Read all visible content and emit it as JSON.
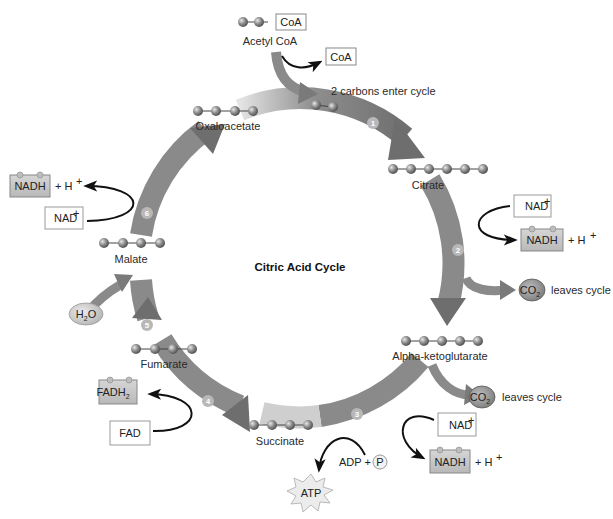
{
  "title": "Citric Acid Cycle",
  "colors": {
    "ring_dark": "#7a7a7a",
    "ring_light": "#d8d8d8",
    "carbon_ball": "#8c8c8c",
    "reduced_box": "#c9c9c9",
    "oxidized_box": "#ffffff",
    "co2_bubble": "#9a9a9a",
    "h2o_bubble": "#d2d2d2",
    "atp_star": "#ececec"
  },
  "input": {
    "acetyl_coa": {
      "label": "Acetyl CoA",
      "coa_tag": "CoA",
      "carbons": 2
    },
    "released_coa": "CoA",
    "enter_note": "2 carbons enter cycle"
  },
  "intermediates": [
    {
      "name": "Citrate",
      "carbons": 6
    },
    {
      "name": "Alpha-ketoglutarate",
      "carbons": 5
    },
    {
      "name": "Succinate",
      "carbons": 4
    },
    {
      "name": "Fumarate",
      "carbons": 4
    },
    {
      "name": "Malate",
      "carbons": 4
    },
    {
      "name": "Oxaloacetate",
      "carbons": 4
    }
  ],
  "steps": [
    "1",
    "2",
    "3",
    "4",
    "5",
    "6"
  ],
  "reactions": {
    "step2": {
      "oxidized": "NAD",
      "oxidized_sup": "+",
      "reduced": "NADH",
      "plus_h": "+ H",
      "h_sup": "+",
      "co2": "CO",
      "co2_sub": "2",
      "co2_note": "leaves cycle"
    },
    "step3": {
      "oxidized": "NAD",
      "oxidized_sup": "+",
      "reduced": "NADH",
      "plus_h": "+ H",
      "h_sup": "+",
      "co2": "CO",
      "co2_sub": "2",
      "co2_note": "leaves cycle",
      "adp": "ADP +",
      "phosphate": "P",
      "atp": "ATP"
    },
    "step4": {
      "oxidized": "FAD",
      "reduced": "FADH",
      "reduced_sub": "2"
    },
    "step5": {
      "water": "H",
      "water_sub": "2",
      "water_end": "O"
    },
    "step6": {
      "oxidized": "NAD",
      "oxidized_sup": "+",
      "reduced": "NADH",
      "plus_h": "+ H",
      "h_sup": "+"
    }
  }
}
